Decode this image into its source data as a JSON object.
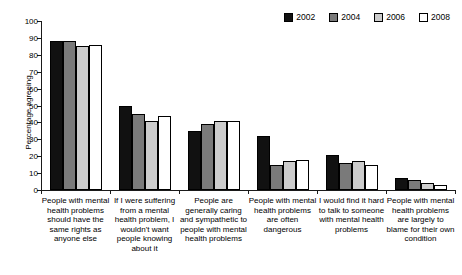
{
  "chart_data": {
    "type": "bar",
    "title": "",
    "xlabel": "",
    "ylabel": "Percentage agreeing",
    "ylim": [
      0,
      100
    ],
    "yticks": [
      0,
      10,
      20,
      30,
      40,
      50,
      60,
      70,
      80,
      90,
      100
    ],
    "grid": false,
    "legend_position": "top-right",
    "categories": [
      "People with mental health problems should have the same rights as anyone else",
      "If I were suffering from a mental health problem, I wouldn't want people knowing about it",
      "People are generally caring and sympathetic to people with mental health problems",
      "People with mental health problems are often dangerous",
      "I would find it hard to talk to someone with mental health problems",
      "People with mental health problems are largely to blame for their own condition"
    ],
    "series": [
      {
        "name": "2002",
        "color": "#111111",
        "values": [
          88,
          50,
          35,
          32,
          21,
          7
        ]
      },
      {
        "name": "2004",
        "color": "#7a7a7a",
        "values": [
          88,
          45,
          39,
          15,
          16,
          6
        ]
      },
      {
        "name": "2006",
        "color": "#cccccc",
        "values": [
          85,
          41,
          41,
          17,
          17,
          4
        ]
      },
      {
        "name": "2008",
        "color": "#ffffff",
        "values": [
          86,
          44,
          41,
          18,
          15,
          3
        ]
      }
    ]
  },
  "legend": {
    "items": [
      {
        "label": "2002",
        "color": "#111111"
      },
      {
        "label": "2004",
        "color": "#7a7a7a"
      },
      {
        "label": "2006",
        "color": "#cccccc"
      },
      {
        "label": "2008",
        "color": "#ffffff"
      }
    ]
  },
  "axes": {
    "y_title": "Percentage agreeing"
  }
}
